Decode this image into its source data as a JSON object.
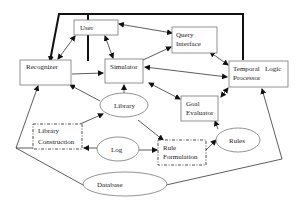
{
  "diagram": {
    "nodes": [
      {
        "id": "user",
        "label_lines": [
          "User"
        ],
        "shape": "rect"
      },
      {
        "id": "query",
        "label_lines": [
          "Query",
          "Interface"
        ],
        "shape": "rect"
      },
      {
        "id": "recognizer",
        "label_lines": [
          "Recognizer"
        ],
        "shape": "rect"
      },
      {
        "id": "simulator",
        "label_lines": [
          "Simulator"
        ],
        "shape": "rect"
      },
      {
        "id": "temporal",
        "label_lines": [
          "Temporal   Logic",
          "Processor"
        ],
        "shape": "rect"
      },
      {
        "id": "library",
        "label_lines": [
          "Library"
        ],
        "shape": "ellipse"
      },
      {
        "id": "goal",
        "label_lines": [
          "Goal",
          "Evaluator"
        ],
        "shape": "rect"
      },
      {
        "id": "libcons",
        "label_lines": [
          "Library",
          "Construction"
        ],
        "shape": "dashdot-rect"
      },
      {
        "id": "log",
        "label_lines": [
          "Log"
        ],
        "shape": "ellipse"
      },
      {
        "id": "rulef",
        "label_lines": [
          "Rule",
          "Formulation"
        ],
        "shape": "dashdot-rect"
      },
      {
        "id": "rules",
        "label_lines": [
          "Rules"
        ],
        "shape": "ellipse"
      },
      {
        "id": "database",
        "label_lines": [
          "Database"
        ],
        "shape": "ellipse"
      }
    ],
    "edges": [
      {
        "from": "temporal",
        "to": "recognizer",
        "style": "thick"
      },
      {
        "from": "user",
        "to": "recognizer",
        "bidirectional": true
      },
      {
        "from": "user",
        "to": "simulator",
        "bidirectional": true
      },
      {
        "from": "user",
        "to": "query",
        "bidirectional": true
      },
      {
        "from": "recognizer",
        "to": "simulator"
      },
      {
        "from": "simulator",
        "to": "query"
      },
      {
        "from": "simulator",
        "to": "temporal",
        "bidirectional": true
      },
      {
        "from": "query",
        "to": "temporal",
        "bidirectional": true
      },
      {
        "from": "simulator",
        "to": "goal",
        "bidirectional": true
      },
      {
        "from": "goal",
        "to": "temporal",
        "bidirectional": true
      },
      {
        "from": "library",
        "to": "simulator"
      },
      {
        "from": "library",
        "to": "recognizer"
      },
      {
        "from": "library",
        "to": "rulef"
      },
      {
        "from": "libcons",
        "to": "library"
      },
      {
        "from": "log",
        "to": "libcons"
      },
      {
        "from": "log",
        "to": "rulef"
      },
      {
        "from": "rulef",
        "to": "rules"
      },
      {
        "from": "rules",
        "to": "goal"
      },
      {
        "from": "database",
        "to": "recognizer"
      },
      {
        "from": "database",
        "to": "temporal"
      }
    ]
  }
}
